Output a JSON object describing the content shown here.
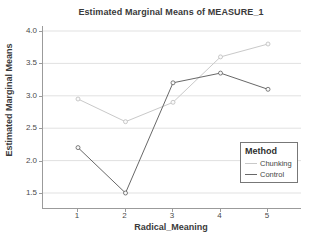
{
  "chart_data": {
    "type": "line",
    "title": "Estimated Marginal Means of MEASURE_1",
    "xlabel": "Radical_Meaning",
    "ylabel": "Estimated Marginal Means",
    "categories": [
      "1",
      "2",
      "3",
      "4",
      "5"
    ],
    "series": [
      {
        "name": "Chunking",
        "values": [
          2.95,
          2.6,
          2.9,
          3.6,
          3.8
        ],
        "color": "#c9c9c9",
        "marker_stroke": "#bdbdbd"
      },
      {
        "name": "Control",
        "values": [
          2.2,
          1.5,
          3.2,
          3.35,
          3.1
        ],
        "color": "#686868",
        "marker_stroke": "#5f5f5f"
      }
    ],
    "ylim": [
      1.5,
      4.0
    ],
    "yticks": [
      "4.0",
      "3.5",
      "3.0",
      "2.5",
      "2.0",
      "1.5"
    ],
    "ytick_values": [
      4.0,
      3.5,
      3.0,
      2.5,
      2.0,
      1.5
    ],
    "grid": "horizontal",
    "gridline_color": "#e1e1e1",
    "axis_color": "#9b9b9b",
    "marker": "open-circle",
    "legend": {
      "title": "Method",
      "position": "right-middle",
      "entries": [
        "Chunking",
        "Control"
      ]
    }
  }
}
